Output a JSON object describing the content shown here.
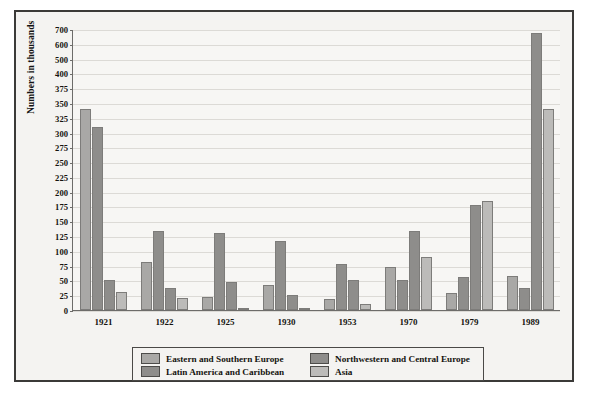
{
  "chart_data": {
    "type": "bar",
    "title": "",
    "xlabel": "",
    "ylabel": "Numbers in thousands",
    "categories": [
      "1921",
      "1922",
      "1925",
      "1930",
      "1953",
      "1970",
      "1979",
      "1989"
    ],
    "yticks": [
      0,
      25,
      50,
      75,
      100,
      125,
      150,
      175,
      200,
      225,
      250,
      275,
      300,
      325,
      350,
      375,
      400,
      500,
      600,
      700
    ],
    "ylim": [
      0,
      700
    ],
    "y_axis_note": "non-linear: equal steps of 25 from 0 to 400, then compressed to 500, 600, 700",
    "grid": true,
    "legend_position": "bottom",
    "series": [
      {
        "name": "Eastern and Southern Europe",
        "color": "#a9a8a6",
        "values": [
          340,
          82,
          22,
          43,
          18,
          72,
          28,
          58
        ]
      },
      {
        "name": "Latin America and Caribbean",
        "color": "#8e8d8b",
        "values": [
          310,
          133,
          130,
          117,
          77,
          50,
          55,
          38
        ]
      },
      {
        "name": "Northwestern and Central Europe",
        "color": "#8e8d8b",
        "values": [
          50,
          38,
          47,
          25,
          50,
          133,
          178,
          670
        ]
      },
      {
        "name": "Asia",
        "color": "#bcbbb9",
        "values": [
          30,
          20,
          2,
          3,
          10,
          90,
          185,
          340
        ]
      }
    ]
  }
}
